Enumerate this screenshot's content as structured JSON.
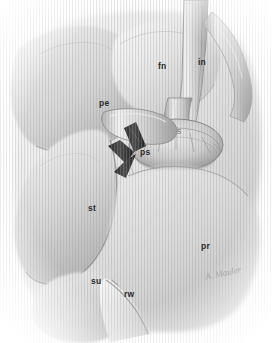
{
  "figure": {
    "kind": "medical-illustration",
    "technique": "grayscale pencil / stipple surgical drawing",
    "width": 272,
    "height": 343,
    "background_color": "#ffffff",
    "ink_color": "#2b2b2b",
    "mid_tone": "#b9b9b9",
    "shadow_tone": "#8a8a8a",
    "instrument_color": "#3a3a3a",
    "caption": ""
  },
  "labels": [
    {
      "id": "fn",
      "text": "fn",
      "x": 158,
      "y": 62
    },
    {
      "id": "in",
      "text": "in",
      "x": 198,
      "y": 58
    },
    {
      "id": "pe",
      "text": "pe",
      "x": 99,
      "y": 99
    },
    {
      "id": "s",
      "text": "s",
      "x": 177,
      "y": 127,
      "faint": true
    },
    {
      "id": "ps",
      "text": "ps",
      "x": 140,
      "y": 148
    },
    {
      "id": "st",
      "text": "st",
      "x": 88,
      "y": 204
    },
    {
      "id": "pr",
      "text": "pr",
      "x": 201,
      "y": 242
    },
    {
      "id": "su",
      "text": "su",
      "x": 91,
      "y": 277
    },
    {
      "id": "rw",
      "text": "rw",
      "x": 124,
      "y": 290
    }
  ],
  "signature": {
    "text": "A. Mauler",
    "x": 205,
    "y": 268
  },
  "structures": [
    {
      "id": "pe",
      "name": "upper-left-lobe"
    },
    {
      "id": "fn",
      "name": "upper-central-fold"
    },
    {
      "id": "in",
      "name": "upper-right-tubular-structure"
    },
    {
      "id": "s",
      "name": "central-stalk"
    },
    {
      "id": "ps",
      "name": "dissected-pedicle"
    },
    {
      "id": "st",
      "name": "large-rounded-organ"
    },
    {
      "id": "pr",
      "name": "lower-right-mass"
    },
    {
      "id": "su",
      "name": "lower-left-fold"
    },
    {
      "id": "rw",
      "name": "lower-central-fold"
    },
    {
      "id": "instrument",
      "name": "surgical-hook-retractor"
    },
    {
      "id": "annulus",
      "name": "central-ring-with-radiating-folds"
    }
  ]
}
